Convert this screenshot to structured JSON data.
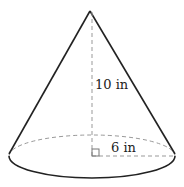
{
  "figure": {
    "type": "cone",
    "height_label": "10 in",
    "radius_label": "6 in",
    "right_angle_marker": true,
    "colors": {
      "stroke": "#222222",
      "dashed": "#999999",
      "background": "#ffffff"
    }
  }
}
